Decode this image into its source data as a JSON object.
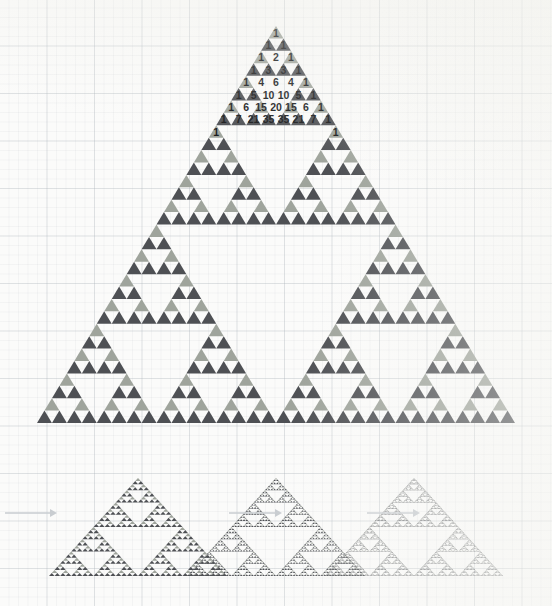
{
  "figure": {
    "type": "diagram",
    "background": "graph-paper",
    "colors": {
      "dark_triangle": "#4e5054",
      "light_triangle": "#9fa49c",
      "paper": "#fbfbfa",
      "grid_major": "#acb4ba",
      "grid_minor": "#bac0c6",
      "number_text": "#17181a",
      "arrow": "#c9cdd1",
      "small_dark": "#4e5054",
      "small_light": "#9fa49c"
    }
  },
  "main_triangle": {
    "name": "pascal-sierpinski-triangle",
    "apex": {
      "x": 276,
      "y": 26
    },
    "base_left": {
      "x": 37,
      "y": 423
    },
    "base_right": {
      "x": 515,
      "y": 423
    },
    "rows_total": 32,
    "labelled_rows": 9,
    "pascal_rows": [
      [
        1
      ],
      [
        1,
        1
      ],
      [
        1,
        2,
        1
      ],
      [
        1,
        3,
        3,
        1
      ],
      [
        1,
        4,
        6,
        4,
        1
      ],
      [
        1,
        5,
        10,
        10,
        5,
        1
      ],
      [
        1,
        6,
        15,
        20,
        15,
        6,
        1
      ],
      [
        1,
        7,
        21,
        35,
        35,
        21,
        7,
        1
      ],
      [
        1,
        "",
        "",
        "",
        "",
        "",
        "",
        "",
        1
      ]
    ],
    "shading_rule": "odd values shaded, even values left blank"
  },
  "iterations": {
    "name": "sierpinski-iteration-strip",
    "arrow_glyph": "→",
    "items": [
      {
        "label": "",
        "order": 1,
        "depth": 5,
        "cx": 138,
        "base_y": 576,
        "half_width": 89,
        "height": 98
      },
      {
        "label": "",
        "order": 2,
        "depth": 6,
        "cx": 276,
        "base_y": 576,
        "half_width": 89,
        "height": 98
      },
      {
        "label": "",
        "order": 3,
        "depth": 7,
        "cx": 414,
        "base_y": 576,
        "half_width": 89,
        "height": 98
      }
    ],
    "arrows": [
      {
        "x1": 5,
        "x2": 57,
        "y": 513
      },
      {
        "x1": 229,
        "x2": 282,
        "y": 513
      },
      {
        "x1": 367,
        "x2": 420,
        "y": 513
      }
    ]
  },
  "numbers_layout": {
    "row_height": 24.8,
    "cell_width": 29.9,
    "font_size": 10.5
  }
}
